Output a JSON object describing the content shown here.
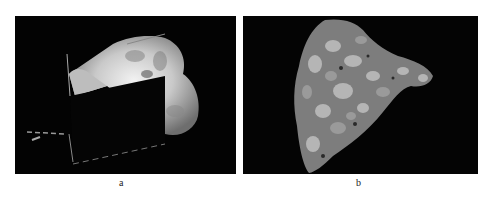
{
  "figure": {
    "panels": [
      {
        "id": "a",
        "label": "a",
        "description": "Dark-field micrograph with bright irregular crystalline region partially occluded by a dark rectangular overlay"
      },
      {
        "id": "b",
        "label": "b",
        "description": "Polished cross-section of a conglomerate-like fragment with grey and white grains on black background"
      }
    ]
  }
}
